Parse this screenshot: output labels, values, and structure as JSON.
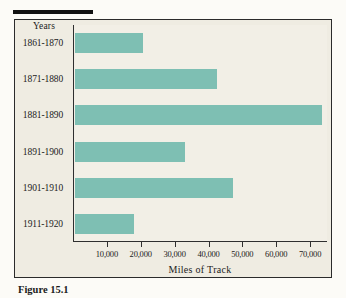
{
  "figure": {
    "caption": "Figure 15.1",
    "background_color": "#efece2",
    "bar_color": "#7ebfb3",
    "axis_color": "#2f2f2f"
  },
  "chart_data": {
    "type": "bar",
    "orientation": "horizontal",
    "title": "",
    "subtitle": "",
    "category_header": "Years",
    "categories": [
      "1861-1870",
      "1871-1880",
      "1881-1890",
      "1891-1900",
      "1901-1910",
      "1911-1920"
    ],
    "values": [
      20000,
      42000,
      73000,
      32500,
      46500,
      17500
    ],
    "series": [
      {
        "name": "Miles of Track",
        "values": [
          20000,
          42000,
          73000,
          32500,
          46500,
          17500
        ]
      }
    ],
    "xlabel": "Miles of Track",
    "ylabel": "Years",
    "xlim": [
      0,
      75000
    ],
    "xticks": [
      10000,
      20000,
      30000,
      40000,
      50000,
      60000,
      70000
    ],
    "xtick_labels": [
      "10,000",
      "20,000",
      "30,000",
      "40,000",
      "50,000",
      "60,000",
      "70,000"
    ],
    "grid": false,
    "legend": false,
    "legend_position": "none"
  }
}
